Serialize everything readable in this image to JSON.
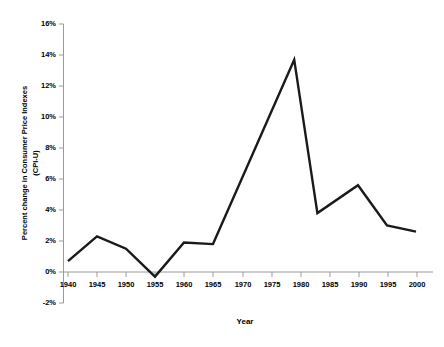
{
  "chart_data": {
    "type": "line",
    "title": "",
    "xlabel": "Year",
    "ylabel": "Percent change in Consumer Price Indexes (CPI-U)",
    "ylabel_line1": "Percent change in Consumer Price Indexes",
    "ylabel_line2": "(CPI-U)",
    "xlim": [
      1938,
      2002
    ],
    "ylim": [
      -2,
      16
    ],
    "grid": false,
    "legend": "none",
    "line_color": "#1a1a1a",
    "axis_color": "#808080",
    "x_ticks": [
      "1940",
      "1945",
      "1950",
      "1955",
      "1960",
      "1965",
      "1970",
      "1975",
      "1980",
      "1985",
      "1990",
      "1995",
      "2000"
    ],
    "y_ticks": [
      "-2%",
      "0%",
      "2%",
      "4%",
      "6%",
      "8%",
      "10%",
      "12%",
      "14%",
      "16%"
    ],
    "x": [
      1940,
      1945,
      1950,
      1955,
      1960,
      1965,
      1979,
      1983,
      1990,
      1995,
      2000
    ],
    "values": [
      0.7,
      2.3,
      1.5,
      -0.3,
      1.9,
      1.8,
      13.7,
      3.8,
      5.6,
      3.0,
      2.6
    ],
    "series": [
      {
        "name": "Percent change in CPI-U",
        "points": [
          {
            "x": 1940,
            "y": 0.7
          },
          {
            "x": 1945,
            "y": 2.3
          },
          {
            "x": 1950,
            "y": 1.5
          },
          {
            "x": 1955,
            "y": -0.3
          },
          {
            "x": 1960,
            "y": 1.9
          },
          {
            "x": 1965,
            "y": 1.8
          },
          {
            "x": 1979,
            "y": 13.7
          },
          {
            "x": 1983,
            "y": 3.8
          },
          {
            "x": 1990,
            "y": 5.6
          },
          {
            "x": 1995,
            "y": 3.0
          },
          {
            "x": 2000,
            "y": 2.6
          }
        ]
      }
    ]
  }
}
